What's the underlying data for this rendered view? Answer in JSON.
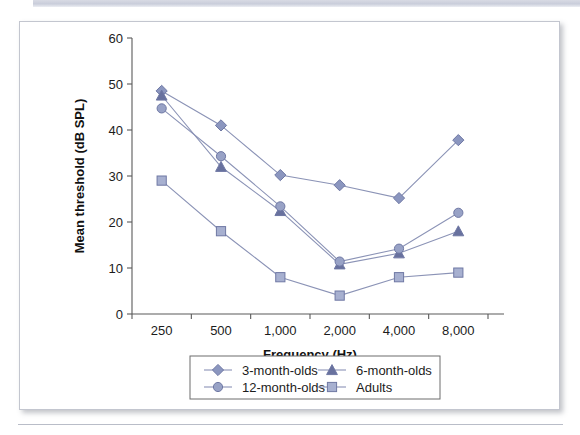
{
  "figure": {
    "background_color": "#ffffff",
    "border_color": "#c3c6cf"
  },
  "chart_data": {
    "type": "line",
    "title": "",
    "xlabel": "Frequency (Hz)",
    "ylabel": "Mean threshold (dB SPL)",
    "categories": [
      "250",
      "500",
      "1,000",
      "2,000",
      "4,000",
      "8,000"
    ],
    "x_tick_labels": [
      "250",
      "500",
      "1,000",
      "2,000",
      "4,000",
      "8,000"
    ],
    "y_tick_labels": [
      "0",
      "10",
      "20",
      "30",
      "40",
      "50",
      "60"
    ],
    "y_ticks": [
      0,
      10,
      20,
      30,
      40,
      50,
      60
    ],
    "ylim": [
      0,
      60
    ],
    "grid": false,
    "legend_position": "bottom",
    "series": [
      {
        "name": "3-month-olds",
        "marker": "diamond",
        "color": "#8b96bf",
        "line_color": "#8b93b6",
        "values": [
          48.5,
          41,
          30.2,
          28,
          25.2,
          37.8
        ]
      },
      {
        "name": "6-month-olds",
        "marker": "triangle",
        "color": "#68719e",
        "line_color": "#8b93b6",
        "values": [
          47.5,
          32,
          22.4,
          10.8,
          13.2,
          18
        ]
      },
      {
        "name": "12-month-olds",
        "marker": "circle",
        "color": "#98a2c6",
        "line_color": "#8b93b6",
        "values": [
          44.7,
          34.3,
          23.4,
          11.4,
          14.2,
          22
        ]
      },
      {
        "name": "Adults",
        "marker": "square",
        "color": "#a7b0d0",
        "line_color": "#8b93b6",
        "values": [
          29,
          18,
          8,
          4,
          8,
          9
        ]
      }
    ]
  },
  "legend": {
    "entries": [
      {
        "label": "3-month-olds",
        "marker": "diamond"
      },
      {
        "label": "6-month-olds",
        "marker": "triangle"
      },
      {
        "label": "12-month-olds",
        "marker": "circle"
      },
      {
        "label": "Adults",
        "marker": "square"
      }
    ]
  }
}
